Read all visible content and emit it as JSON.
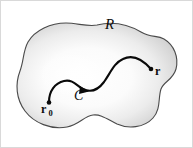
{
  "figure": {
    "type": "vector-calculus-region-diagram",
    "background_color": "#ffffff",
    "border_color": "#d9d9d9",
    "region": {
      "label": "R",
      "fill_center_color": "#ffffff",
      "fill_edge_color": "#d0d0d0",
      "stroke_color": "#4a4a4a"
    },
    "curve": {
      "label": "C",
      "stroke_color": "#0a0a0a",
      "orientation": "from r0 to r"
    },
    "start_point": {
      "label": "r",
      "subscript": "0"
    },
    "end_point": {
      "label": "r",
      "subscript": ""
    }
  }
}
